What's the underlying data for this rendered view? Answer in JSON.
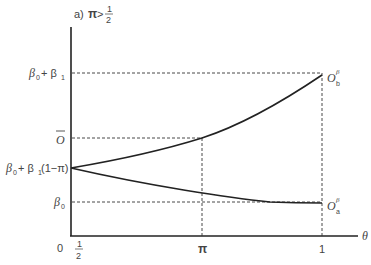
{
  "title": {
    "prefix": "a)",
    "condition_lhs": "π",
    "operator": ">",
    "frac_num": "1",
    "frac_den": "2"
  },
  "axes": {
    "x_label": "θ",
    "x_ticks": [
      {
        "label_type": "fraction",
        "num": "1",
        "den": "2",
        "value": 0.5
      },
      {
        "label": "π",
        "value": "pi"
      },
      {
        "label": "1",
        "value": 1
      }
    ],
    "origin_label": "0",
    "y_ticks": [
      {
        "label_main": "β",
        "sub": "0",
        "suffix": " + β",
        "sub2": "1",
        "id": "b0_plus_b1"
      },
      {
        "label_main": "O",
        "overline": true,
        "id": "o_bar"
      },
      {
        "label_main": "β",
        "sub": "0",
        "suffix": " + β",
        "sub2": "1",
        "tail": "(1−π)",
        "id": "b0_plus_b1_1_minus_pi"
      },
      {
        "label_main": "β",
        "sub": "0",
        "id": "b0"
      }
    ]
  },
  "curves": [
    {
      "name": "O_b^β",
      "label_main": "O",
      "sub": "b",
      "sup": "β",
      "direction": "increasing"
    },
    {
      "name": "O_a^β",
      "label_main": "O",
      "sub": "a",
      "sup": "β",
      "direction": "decreasing"
    }
  ],
  "colors": {
    "axis": "#222222",
    "curve": "#222222",
    "dashed": "#333333",
    "text": "#444444"
  }
}
